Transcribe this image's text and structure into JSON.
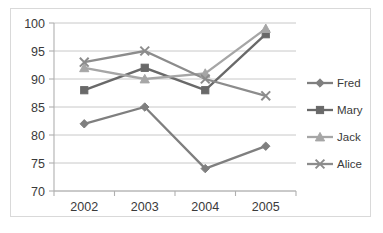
{
  "chart_data": {
    "type": "line",
    "title": "",
    "xlabel": "",
    "ylabel": "",
    "categories": [
      "2002",
      "2003",
      "2004",
      "2005"
    ],
    "x": [
      2002,
      2003,
      2004,
      2005
    ],
    "ylim": [
      70,
      100
    ],
    "yticks": [
      70,
      75,
      80,
      85,
      90,
      95,
      100
    ],
    "grid": "horizontal",
    "legend_position": "right",
    "series": [
      {
        "name": "Fred",
        "values": [
          82,
          85,
          74,
          78
        ],
        "color": "#7f7f7f",
        "marker": "diamond"
      },
      {
        "name": "Mary",
        "values": [
          88,
          92,
          88,
          98
        ],
        "color": "#696969",
        "marker": "square"
      },
      {
        "name": "Jack",
        "values": [
          92,
          90,
          91,
          99
        ],
        "color": "#a6a6a6",
        "marker": "triangle"
      },
      {
        "name": "Alice",
        "values": [
          93,
          95,
          90,
          87
        ],
        "color": "#8c8c8c",
        "marker": "x"
      }
    ]
  },
  "axis": {
    "y_tick_labels": [
      "100",
      "95",
      "90",
      "85",
      "80",
      "75",
      "70"
    ],
    "x_tick_labels": [
      "2002",
      "2003",
      "2004",
      "2005"
    ]
  },
  "legend": {
    "entries": [
      {
        "label": "Fred"
      },
      {
        "label": "Mary"
      },
      {
        "label": "Jack"
      },
      {
        "label": "Alice"
      }
    ]
  }
}
